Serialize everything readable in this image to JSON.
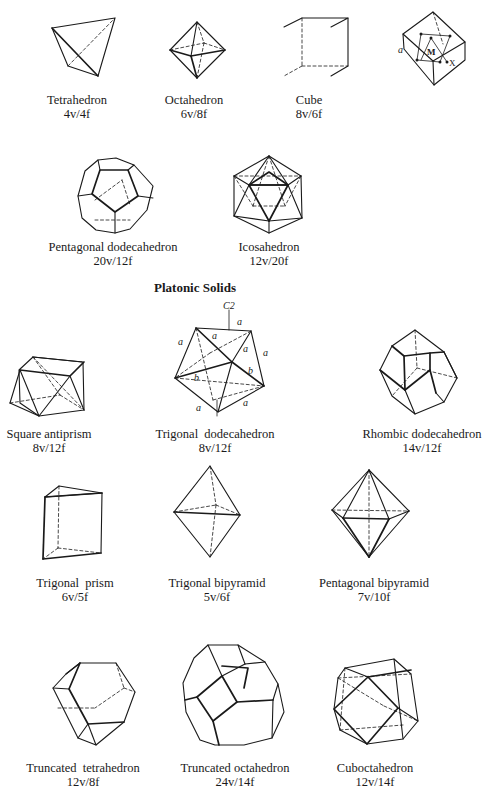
{
  "figure": {
    "section_title": "Platonic Solids",
    "solids": [
      {
        "id": "tetrahedron",
        "name": "Tetrahedron",
        "counts": "4v/4f"
      },
      {
        "id": "octahedron",
        "name": "Octahedron",
        "counts": "6v/8f"
      },
      {
        "id": "cube",
        "name": "Cube",
        "counts": "8v/6f"
      },
      {
        "id": "unit-cell",
        "name": "",
        "counts": "",
        "annotations": {
          "edge": "a",
          "center": "M",
          "vertex": "X"
        }
      },
      {
        "id": "pentagonal-dodecahedron",
        "name": "Pentagonal dodecahedron",
        "counts": "20v/12f"
      },
      {
        "id": "icosahedron",
        "name": "Icosahedron",
        "counts": "12v/20f"
      },
      {
        "id": "square-antiprism",
        "name": "Square antiprism",
        "counts": "8v/12f"
      },
      {
        "id": "trigonal-dodecahedron",
        "name": "Trigonal  dodecahedron",
        "counts": "8v/12f",
        "annotations": {
          "axis": "C2",
          "edge_a": "a",
          "edge_b": "b"
        }
      },
      {
        "id": "rhombic-dodecahedron",
        "name": "Rhombic dodecahedron",
        "counts": "14v/12f"
      },
      {
        "id": "trigonal-prism",
        "name": "Trigonal  prism",
        "counts": "6v/5f"
      },
      {
        "id": "trigonal-bipyramid",
        "name": "Trigonal bipyramid",
        "counts": "5v/6f"
      },
      {
        "id": "pentagonal-bipyramid",
        "name": "Pentagonal bipyramid",
        "counts": "7v/10f"
      },
      {
        "id": "truncated-tetrahedron",
        "name": "Truncated  tetrahedron",
        "counts": "12v/8f"
      },
      {
        "id": "truncated-octahedron",
        "name": "Truncated octahedron",
        "counts": "24v/14f"
      },
      {
        "id": "cuboctahedron",
        "name": "Cuboctahedron",
        "counts": "12v/14f"
      }
    ]
  }
}
